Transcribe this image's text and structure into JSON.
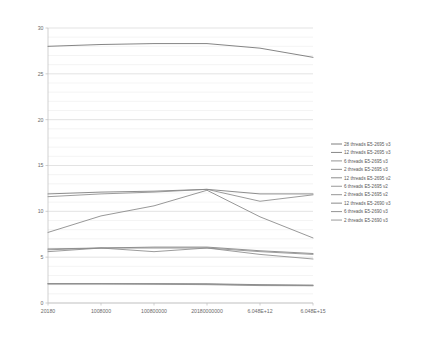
{
  "chart_data": {
    "type": "line",
    "title": "",
    "xlabel": "",
    "ylabel": "",
    "grid": true,
    "legend_position": "right",
    "ylim": [
      0,
      30
    ],
    "yticks": [
      0,
      5,
      10,
      15,
      20,
      25,
      30
    ],
    "ytick_labels": [
      "0",
      "5",
      "10",
      "15",
      "20",
      "25",
      "30"
    ],
    "y_minor_step": 1,
    "categories": [
      "20180",
      "1008000",
      "100800000",
      "20180000000",
      "6.048E+12",
      "6.048E+15"
    ],
    "x": [
      "20180",
      "1008000",
      "100800000",
      "20180000000",
      "6.048E+12",
      "6.048E+15"
    ],
    "series": [
      {
        "name": "28 threads E5-2695 v3",
        "color": "#6f6f6f",
        "values": [
          28.0,
          28.2,
          28.3,
          28.3,
          27.8,
          26.8
        ]
      },
      {
        "name": "12 threads E5-2695 v3",
        "color": "#7a7a7a",
        "values": [
          11.9,
          12.1,
          12.2,
          12.4,
          11.9,
          11.9
        ]
      },
      {
        "name": "6 threads E5-2695 v3",
        "color": "#8a8a8a",
        "values": [
          11.6,
          11.9,
          12.1,
          12.4,
          11.1,
          11.8
        ]
      },
      {
        "name": "2 threads E5-2695 v3",
        "color": "#858585",
        "values": [
          7.7,
          9.5,
          10.6,
          12.3,
          9.4,
          7.1
        ]
      },
      {
        "name": "12 threads E5-2695 v2",
        "color": "#808080",
        "values": [
          5.9,
          6.0,
          6.1,
          6.1,
          5.7,
          5.4
        ]
      },
      {
        "name": "6 threads E5-2695 v2",
        "color": "#8d8d8d",
        "values": [
          5.8,
          6.0,
          6.0,
          6.0,
          5.6,
          5.3
        ]
      },
      {
        "name": "2 threads E5-2695 v2",
        "color": "#8a8a8a",
        "values": [
          5.6,
          6.0,
          5.6,
          6.0,
          5.3,
          4.8
        ]
      },
      {
        "name": "12  threads E5-2690 v3",
        "color": "#7d7d7d",
        "values": [
          2.1,
          2.1,
          2.1,
          2.1,
          2.0,
          1.95
        ]
      },
      {
        "name": "6  threads E5-2690 v3",
        "color": "#888888",
        "values": [
          2.1,
          2.1,
          2.1,
          2.05,
          1.95,
          1.9
        ]
      },
      {
        "name": "2 threads E5-2690 v3",
        "color": "#8f8f8f",
        "values": [
          2.1,
          2.1,
          2.05,
          2.0,
          1.9,
          1.88
        ]
      }
    ]
  }
}
